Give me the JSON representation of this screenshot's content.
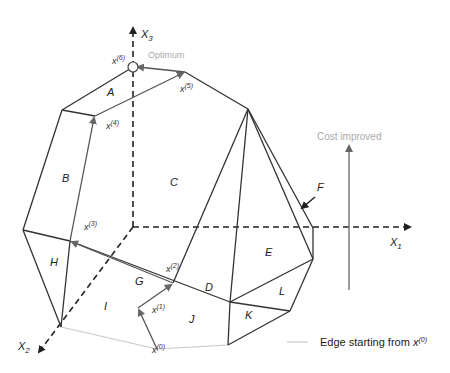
{
  "axes": {
    "x1": "X",
    "x1_sub": "1",
    "x2": "X",
    "x2_sub": "2",
    "x3": "X",
    "x3_sub": "3"
  },
  "faces": {
    "A": "A",
    "B": "B",
    "C": "C",
    "D": "D",
    "E": "E",
    "F": "F",
    "G": "G",
    "H": "H",
    "I": "I",
    "J": "J",
    "K": "K",
    "L": "L"
  },
  "vertices": {
    "x0": {
      "base": "x",
      "sup": "(0)"
    },
    "x1": {
      "base": "x",
      "sup": "(1)"
    },
    "x2": {
      "base": "x",
      "sup": "(2)"
    },
    "x3": {
      "base": "x",
      "sup": "(3)"
    },
    "x4": {
      "base": "x",
      "sup": "(4)"
    },
    "x5": {
      "base": "x",
      "sup": "(5)"
    },
    "x6": {
      "base": "x",
      "sup": "(6)"
    }
  },
  "labels": {
    "optimum": "Optimum",
    "cost_improved": "Cost improved"
  },
  "legend": {
    "text": "Edge starting from ",
    "base": "x",
    "sup": "(0)"
  },
  "colors": {
    "edge": "#333333",
    "path": "#555555",
    "light_edge": "#c8c8c8",
    "annotation": "#aaaaaa"
  }
}
